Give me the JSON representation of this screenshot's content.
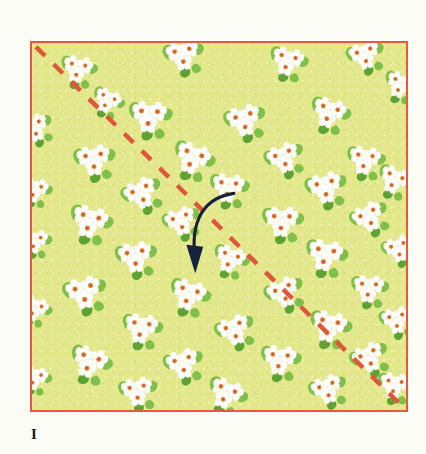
{
  "figure": {
    "caption_label": "I"
  },
  "colors": {
    "page_background": "#fdfdf7",
    "fabric_ground": "#e3e88c",
    "fabric_border": "#e8583d",
    "dashed_line": "#e0563a",
    "arrow": "#17223f",
    "petal_white": "#ffffff",
    "petal_shadow": "#f2e9c9",
    "flower_center": "#e07a35",
    "flower_center_dark": "#c9551f",
    "leaf_green": "#7fbf4a",
    "leaf_green_dark": "#5fa234",
    "caption_text": "#1a1a1a"
  },
  "fabric": {
    "square": {
      "x": 30,
      "y": 41,
      "width": 378,
      "height": 371
    },
    "border_width": 2.5
  },
  "diagonal": {
    "name": "fold-guideline",
    "style": "dashed",
    "x1": 4,
    "y1": 4,
    "x2": 374,
    "y2": 367,
    "stroke_width": 4.5,
    "dash_length": 13,
    "gap_length": 12
  },
  "arrow": {
    "name": "fold-direction-arrow",
    "path": "M 204 152 C 176 156, 163 178, 164 214",
    "head": "164 232 157 207 171 207",
    "stroke_width": 3.2
  },
  "chart_data": {
    "type": "diagram",
    "elements": [
      {
        "name": "fabric-square",
        "shape": "square",
        "fill": "#e3e88c",
        "stroke": "#e8583d"
      },
      {
        "name": "fold-guideline",
        "shape": "dashed-diagonal",
        "from": "top-left",
        "to": "bottom-right",
        "stroke": "#e0563a"
      },
      {
        "name": "fold-direction-arrow",
        "shape": "curved-arrow",
        "direction": "down-left",
        "stroke": "#17223f"
      },
      {
        "name": "floral-print",
        "shape": "repeating-motif",
        "motif": "white five-petal flower clusters with green leaves"
      }
    ],
    "labels": [
      "I"
    ]
  },
  "flowers": [
    {
      "x": 46,
      "y": 26,
      "s": 0.78,
      "r": 12
    },
    {
      "x": 152,
      "y": 12,
      "s": 0.86,
      "r": -8
    },
    {
      "x": 76,
      "y": 58,
      "s": 0.7,
      "r": 25
    },
    {
      "x": 258,
      "y": 18,
      "s": 0.82,
      "r": 15
    },
    {
      "x": 336,
      "y": 12,
      "s": 0.8,
      "r": -14
    },
    {
      "x": 372,
      "y": 42,
      "s": 0.74,
      "r": 20
    },
    {
      "x": 2,
      "y": 86,
      "s": 0.76,
      "r": -20
    },
    {
      "x": 118,
      "y": 74,
      "s": 0.92,
      "r": 6
    },
    {
      "x": 214,
      "y": 78,
      "s": 0.88,
      "r": -12
    },
    {
      "x": 300,
      "y": 70,
      "s": 0.86,
      "r": 18
    },
    {
      "x": 62,
      "y": 118,
      "s": 0.88,
      "r": -5
    },
    {
      "x": 162,
      "y": 116,
      "s": 0.9,
      "r": 22
    },
    {
      "x": 254,
      "y": 116,
      "s": 0.84,
      "r": -18
    },
    {
      "x": 336,
      "y": 118,
      "s": 0.82,
      "r": 10
    },
    {
      "x": 2,
      "y": 148,
      "s": 0.72,
      "r": 14
    },
    {
      "x": 110,
      "y": 152,
      "s": 0.86,
      "r": -22
    },
    {
      "x": 198,
      "y": 146,
      "s": 0.84,
      "r": 8
    },
    {
      "x": 296,
      "y": 146,
      "s": 0.88,
      "r": -10
    },
    {
      "x": 366,
      "y": 138,
      "s": 0.78,
      "r": 24
    },
    {
      "x": 58,
      "y": 180,
      "s": 0.92,
      "r": 16
    },
    {
      "x": 150,
      "y": 180,
      "s": 0.8,
      "r": -16
    },
    {
      "x": 252,
      "y": 180,
      "s": 0.88,
      "r": 4
    },
    {
      "x": 340,
      "y": 176,
      "s": 0.82,
      "r": -24
    },
    {
      "x": 2,
      "y": 200,
      "s": 0.7,
      "r": 8
    },
    {
      "x": 104,
      "y": 216,
      "s": 0.88,
      "r": -6
    },
    {
      "x": 200,
      "y": 218,
      "s": 0.78,
      "r": 20
    },
    {
      "x": 296,
      "y": 214,
      "s": 0.9,
      "r": 12
    },
    {
      "x": 370,
      "y": 208,
      "s": 0.74,
      "r": -14
    },
    {
      "x": 52,
      "y": 252,
      "s": 0.92,
      "r": -10
    },
    {
      "x": 158,
      "y": 254,
      "s": 0.88,
      "r": 18
    },
    {
      "x": 254,
      "y": 252,
      "s": 0.84,
      "r": -20
    },
    {
      "x": 340,
      "y": 248,
      "s": 0.8,
      "r": 6
    },
    {
      "x": 2,
      "y": 268,
      "s": 0.72,
      "r": 22
    },
    {
      "x": 110,
      "y": 288,
      "s": 0.86,
      "r": 10
    },
    {
      "x": 204,
      "y": 290,
      "s": 0.84,
      "r": -18
    },
    {
      "x": 300,
      "y": 286,
      "s": 0.9,
      "r": 14
    },
    {
      "x": 368,
      "y": 280,
      "s": 0.76,
      "r": -8
    },
    {
      "x": 58,
      "y": 322,
      "s": 0.9,
      "r": 20
    },
    {
      "x": 152,
      "y": 324,
      "s": 0.84,
      "r": -12
    },
    {
      "x": 250,
      "y": 320,
      "s": 0.86,
      "r": 8
    },
    {
      "x": 340,
      "y": 318,
      "s": 0.82,
      "r": -22
    },
    {
      "x": 2,
      "y": 338,
      "s": 0.7,
      "r": 16
    },
    {
      "x": 106,
      "y": 352,
      "s": 0.82,
      "r": -6
    },
    {
      "x": 196,
      "y": 354,
      "s": 0.86,
      "r": 24
    },
    {
      "x": 298,
      "y": 350,
      "s": 0.8,
      "r": -16
    },
    {
      "x": 366,
      "y": 346,
      "s": 0.76,
      "r": 10
    }
  ]
}
